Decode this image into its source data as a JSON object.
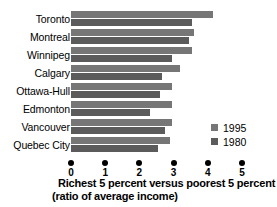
{
  "chart_data": {
    "type": "bar",
    "orientation": "horizontal",
    "title": "Richest 5 percent versus poorest 5 percent",
    "subtitle": "(ratio of average income)",
    "xlabel": "Richest 5 percent versus poorest 5 percent (ratio of average income)",
    "ylabel": "",
    "xlim": [
      0,
      5
    ],
    "ylim": null,
    "grid": false,
    "legend_position": "right-bottom",
    "categories": [
      "Toronto",
      "Montreal",
      "Winnipeg",
      "Calgary",
      "Ottawa-Hull",
      "Edmonton",
      "Vancouver",
      "Quebec City"
    ],
    "tick_labels": [
      "0",
      "1",
      "2",
      "3",
      "4",
      "5"
    ],
    "tick_values": [
      0,
      1,
      2,
      3,
      4,
      5
    ],
    "series": [
      {
        "name": "1995",
        "color": "#767676",
        "values": [
          4.15,
          3.6,
          3.55,
          3.2,
          2.95,
          2.95,
          2.95,
          2.9
        ]
      },
      {
        "name": "1980",
        "color": "#5b5b5b",
        "values": [
          3.55,
          3.45,
          2.95,
          2.65,
          2.6,
          2.3,
          2.75,
          2.55
        ]
      }
    ]
  },
  "caption": {
    "line1": "Richest 5 percent versus poorest 5 percent",
    "line2": "(ratio of average income)"
  }
}
